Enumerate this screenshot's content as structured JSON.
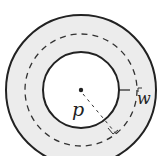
{
  "diagram": {
    "type": "annulus",
    "labels": {
      "center": "p",
      "width": "w"
    },
    "colors": {
      "ring_fill": "#ececec",
      "stroke": "#222222",
      "background": "#ffffff"
    }
  }
}
